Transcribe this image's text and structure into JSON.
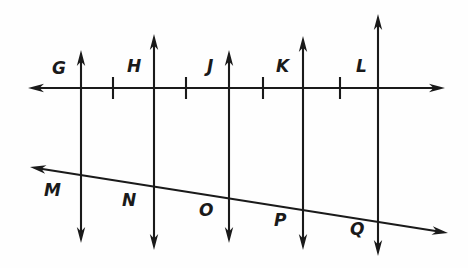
{
  "figure": {
    "type": "geometry-diagram",
    "background_color": "#fefefe",
    "stroke_color": "#1a1a1a",
    "canvas": {
      "width": 468,
      "height": 268
    }
  },
  "lines": {
    "horizontal": {
      "name": "horizontal-transversal",
      "x1": 28,
      "y1": 88,
      "x2": 445,
      "y2": 88,
      "arrow_start": true,
      "arrow_end": true
    },
    "oblique": {
      "name": "oblique-transversal",
      "x1": 30,
      "y1": 167,
      "x2": 448,
      "y2": 233,
      "arrow_start": true,
      "arrow_end": true
    },
    "verticals": [
      {
        "name": "vertical-line-gm",
        "x": 81,
        "y_top": 50,
        "y_bottom": 243,
        "arrow_top": true,
        "arrow_bottom": true
      },
      {
        "name": "vertical-line-hn",
        "x": 154,
        "y_top": 34,
        "y_bottom": 250,
        "arrow_top": true,
        "arrow_bottom": true
      },
      {
        "name": "vertical-line-jo",
        "x": 229,
        "y_top": 50,
        "y_bottom": 243,
        "arrow_top": true,
        "arrow_bottom": true
      },
      {
        "name": "vertical-line-kp",
        "x": 303,
        "y_top": 36,
        "y_bottom": 250,
        "arrow_top": true,
        "arrow_bottom": true
      },
      {
        "name": "vertical-line-lq",
        "x": 378,
        "y_top": 14,
        "y_bottom": 256,
        "arrow_top": true,
        "arrow_bottom": true
      }
    ]
  },
  "tick_marks": [
    {
      "name": "tick-mark-1",
      "x": 113,
      "y": 88,
      "half_height": 11
    },
    {
      "name": "tick-mark-2",
      "x": 186,
      "y": 88,
      "half_height": 11
    },
    {
      "name": "tick-mark-3",
      "x": 263,
      "y": 88,
      "half_height": 11
    },
    {
      "name": "tick-mark-4",
      "x": 340,
      "y": 88,
      "half_height": 11
    }
  ],
  "labels": {
    "top_row": [
      {
        "name": "point-label-g",
        "text": "G",
        "x": 52,
        "y": 60
      },
      {
        "name": "point-label-h",
        "text": "H",
        "x": 127,
        "y": 58
      },
      {
        "name": "point-label-j",
        "text": "J",
        "x": 207,
        "y": 58
      },
      {
        "name": "point-label-k",
        "text": "K",
        "x": 276,
        "y": 58
      },
      {
        "name": "point-label-l",
        "text": "L",
        "x": 356,
        "y": 58
      }
    ],
    "bottom_row": [
      {
        "name": "point-label-m",
        "text": "M",
        "x": 44,
        "y": 182
      },
      {
        "name": "point-label-n",
        "text": "N",
        "x": 122,
        "y": 192
      },
      {
        "name": "point-label-o",
        "text": "O",
        "x": 199,
        "y": 202
      },
      {
        "name": "point-label-p",
        "text": "P",
        "x": 274,
        "y": 212
      },
      {
        "name": "point-label-q",
        "text": "Q",
        "x": 350,
        "y": 221
      }
    ]
  }
}
